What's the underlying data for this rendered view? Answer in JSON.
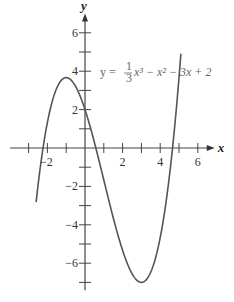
{
  "chart_data": {
    "type": "line",
    "title": "",
    "function": "y = (1/3)x^3 - x^2 - 3x + 2",
    "annotation": {
      "prefix": "y  =",
      "frac_num": "1",
      "frac_den": "3",
      "rest": "x³  −  x²  −  3x  +  2"
    },
    "xlabel": "x",
    "ylabel": "y",
    "xlim": [
      -3.3,
      6.9
    ],
    "ylim": [
      -7.3,
      6.9
    ],
    "x_ticks": [
      -3,
      -2,
      -1,
      1,
      2,
      3,
      4,
      5,
      6
    ],
    "x_tick_labels": [
      {
        "value": -2,
        "label": "−2"
      },
      {
        "value": 2,
        "label": "2"
      },
      {
        "value": 4,
        "label": "4"
      },
      {
        "value": 6,
        "label": "6"
      }
    ],
    "y_ticks": [
      -7,
      -6,
      -5,
      -4,
      -3,
      -2,
      -1,
      1,
      2,
      3,
      4,
      5,
      6
    ],
    "y_tick_labels": [
      {
        "value": 6,
        "label": "6"
      },
      {
        "value": 4,
        "label": "4"
      },
      {
        "value": 2,
        "label": "2"
      },
      {
        "value": -2,
        "label": "−2"
      },
      {
        "value": -4,
        "label": "−4"
      },
      {
        "value": -6,
        "label": "−6"
      }
    ],
    "x_domain": [
      -2.6,
      5.1
    ],
    "key_points": [
      {
        "name": "local max",
        "x": -1,
        "y": 3.67
      },
      {
        "name": "local min",
        "x": 3,
        "y": -7
      },
      {
        "name": "y-intercept",
        "x": 0,
        "y": 2
      }
    ],
    "grid": false,
    "legend": null
  }
}
